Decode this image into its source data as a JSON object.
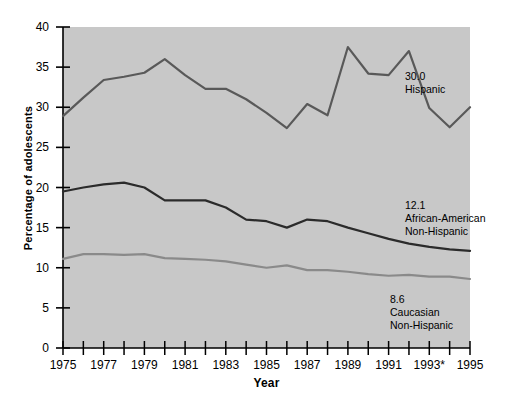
{
  "chart_data": {
    "type": "line",
    "title": "",
    "xlabel": "Year",
    "ylabel": "Percentage of adolescents",
    "xlim": [
      1975,
      1995
    ],
    "ylim": [
      0,
      40
    ],
    "yticks": [
      0,
      5,
      10,
      15,
      20,
      25,
      30,
      35,
      40
    ],
    "ytick_labels": [
      "0",
      "5",
      "10",
      "15",
      "20",
      "25",
      "30",
      "35",
      "40"
    ],
    "xticks": [
      1975,
      1976,
      1977,
      1978,
      1979,
      1980,
      1981,
      1982,
      1983,
      1984,
      1985,
      1986,
      1987,
      1988,
      1989,
      1990,
      1991,
      1992,
      1993,
      1994,
      1995
    ],
    "xtick_labels": [
      "1975",
      "",
      "1977",
      "",
      "1979",
      "",
      "1981",
      "",
      "1983",
      "",
      "1985",
      "",
      "1987",
      "",
      "1989",
      "",
      "1991",
      "",
      "1993*",
      "",
      "1995"
    ],
    "grid": false,
    "legend_position": "inline-right",
    "plot_background": "#c8c8c8",
    "x": [
      1975,
      1976,
      1977,
      1978,
      1979,
      1980,
      1981,
      1982,
      1983,
      1984,
      1985,
      1986,
      1987,
      1988,
      1989,
      1990,
      1991,
      1992,
      1993,
      1994,
      1995
    ],
    "series": [
      {
        "name": "Hispanic",
        "color": "#595959",
        "end_value": "30.0",
        "values": [
          28.9,
          31.2,
          33.4,
          33.8,
          34.3,
          36.0,
          34.0,
          32.3,
          32.3,
          31.0,
          29.3,
          27.4,
          30.4,
          29.0,
          37.5,
          34.2,
          34.0,
          37.0,
          29.9,
          27.5,
          30.0
        ]
      },
      {
        "name": "African-American Non-Hispanic",
        "color": "#2b2b2b",
        "end_value": "12.1",
        "values": [
          19.5,
          20.0,
          20.4,
          20.6,
          20.0,
          18.4,
          18.4,
          18.4,
          17.5,
          16.0,
          15.8,
          15.0,
          16.0,
          15.8,
          15.0,
          14.3,
          13.6,
          13.0,
          12.6,
          12.3,
          12.1
        ]
      },
      {
        "name": "Caucasian Non-Hispanic",
        "color": "#8a8a8a",
        "end_value": "8.6",
        "values": [
          11.1,
          11.7,
          11.7,
          11.6,
          11.7,
          11.2,
          11.1,
          11.0,
          10.8,
          10.4,
          10.0,
          10.3,
          9.7,
          9.7,
          9.5,
          9.2,
          9.0,
          9.1,
          8.9,
          8.9,
          8.6
        ]
      }
    ],
    "annotations": [
      {
        "id": "hispanic",
        "value": "30.0",
        "line1": "Hispanic",
        "line2": ""
      },
      {
        "id": "african-american",
        "value": "12.1",
        "line1": "African-American",
        "line2": "Non-Hispanic"
      },
      {
        "id": "caucasian",
        "value": "8.6",
        "line1": "Caucasian",
        "line2": "Non-Hispanic"
      }
    ]
  },
  "axes": {
    "x_title": "Year",
    "y_title": "Percentage of adolescents"
  }
}
